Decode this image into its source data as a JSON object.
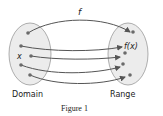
{
  "figure": {
    "caption": "Figure 1",
    "function_label": "f",
    "domain_label": "Domain",
    "range_label": "Range",
    "element_label": "x",
    "image_label": "f(x)"
  },
  "colors": {
    "ellipse_fill": "#ececec",
    "ellipse_stroke": "#9a9a9a",
    "arrow": "#555555",
    "dot": "#6a6a6a",
    "text": "#222222"
  },
  "domain_points": [
    {
      "x": 28,
      "y": 33
    },
    {
      "x": 21,
      "y": 46
    },
    {
      "x": 31,
      "y": 56
    },
    {
      "x": 21,
      "y": 65
    },
    {
      "x": 30,
      "y": 75
    }
  ],
  "range_points": [
    {
      "x": 133,
      "y": 32
    },
    {
      "x": 125,
      "y": 53
    },
    {
      "x": 123,
      "y": 64
    },
    {
      "x": 130,
      "y": 75
    }
  ]
}
